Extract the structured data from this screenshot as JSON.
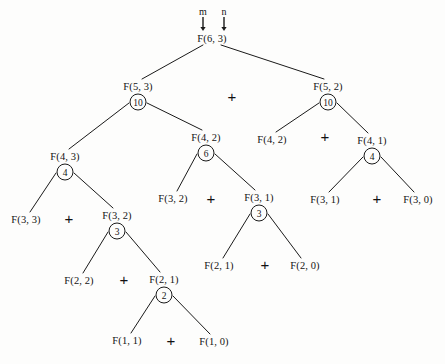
{
  "diagram": {
    "root_label": "F(6, 3)",
    "annotations": [
      {
        "name": "m-pointer",
        "text": "m",
        "x": 203,
        "y": 11
      },
      {
        "name": "n-pointer",
        "text": "n",
        "x": 224,
        "y": 11
      }
    ],
    "arrows": [
      {
        "name": "m-arrow",
        "x": 203,
        "y": 17,
        "length": 11
      },
      {
        "name": "n-arrow",
        "x": 224,
        "y": 17,
        "length": 11
      }
    ],
    "nodes": [
      {
        "id": "n0",
        "label": "F(6, 3)",
        "x": 212,
        "y": 38,
        "value": null
      },
      {
        "id": "n1",
        "label": "F(5, 3)",
        "x": 138,
        "y": 86,
        "value": "10"
      },
      {
        "id": "n2",
        "label": "F(5, 2)",
        "x": 328,
        "y": 86,
        "value": "10"
      },
      {
        "id": "n3",
        "label": "F(4, 3)",
        "x": 65,
        "y": 156,
        "value": "4"
      },
      {
        "id": "n4",
        "label": "F(4, 2)",
        "x": 206,
        "y": 137,
        "value": "6"
      },
      {
        "id": "n5",
        "label": "F(4, 2)",
        "x": 272,
        "y": 139,
        "value": null
      },
      {
        "id": "n6",
        "label": "F(4, 1)",
        "x": 372,
        "y": 140,
        "value": "4"
      },
      {
        "id": "n7",
        "label": "F(3, 3)",
        "x": 26,
        "y": 219,
        "value": null
      },
      {
        "id": "n8",
        "label": "F(3, 2)",
        "x": 117,
        "y": 215,
        "value": "3"
      },
      {
        "id": "n9",
        "label": "F(3, 2)",
        "x": 173,
        "y": 198,
        "value": null
      },
      {
        "id": "n10",
        "label": "F(3, 1)",
        "x": 259,
        "y": 197,
        "value": "3"
      },
      {
        "id": "n11",
        "label": "F(3, 1)",
        "x": 325,
        "y": 199,
        "value": null
      },
      {
        "id": "n12",
        "label": "F(3, 0)",
        "x": 418,
        "y": 199,
        "value": null
      },
      {
        "id": "n13",
        "label": "F(2, 2)",
        "x": 79,
        "y": 280,
        "value": null
      },
      {
        "id": "n14",
        "label": "F(2, 1)",
        "x": 164,
        "y": 279,
        "value": "2"
      },
      {
        "id": "n15",
        "label": "F(2, 1)",
        "x": 219,
        "y": 265,
        "value": null
      },
      {
        "id": "n16",
        "label": "F(2, 0)",
        "x": 305,
        "y": 265,
        "value": null
      },
      {
        "id": "n17",
        "label": "F(1, 1)",
        "x": 127,
        "y": 340,
        "value": null
      },
      {
        "id": "n18",
        "label": "F(1, 0)",
        "x": 214,
        "y": 341,
        "value": null
      }
    ],
    "plus_signs": [
      {
        "name": "plus-root",
        "x": 232,
        "y": 96
      },
      {
        "name": "plus-n2",
        "x": 325,
        "y": 136
      },
      {
        "name": "plus-n1",
        "x": 211,
        "y": 198
      },
      {
        "name": "plus-n6",
        "x": 377,
        "y": 198
      },
      {
        "name": "plus-n3",
        "x": 69,
        "y": 218
      },
      {
        "name": "plus-n10",
        "x": 265,
        "y": 264
      },
      {
        "name": "plus-n8",
        "x": 124,
        "y": 279
      },
      {
        "name": "plus-n14",
        "x": 171,
        "y": 340
      }
    ],
    "edges": [
      {
        "from": "n0",
        "to": "n1"
      },
      {
        "from": "n0",
        "to": "n2"
      },
      {
        "from": "n1",
        "to": "n3"
      },
      {
        "from": "n1",
        "to": "n4"
      },
      {
        "from": "n2",
        "to": "n5"
      },
      {
        "from": "n2",
        "to": "n6"
      },
      {
        "from": "n3",
        "to": "n7"
      },
      {
        "from": "n3",
        "to": "n8"
      },
      {
        "from": "n4",
        "to": "n9"
      },
      {
        "from": "n4",
        "to": "n10"
      },
      {
        "from": "n6",
        "to": "n11"
      },
      {
        "from": "n6",
        "to": "n12"
      },
      {
        "from": "n8",
        "to": "n13"
      },
      {
        "from": "n8",
        "to": "n14"
      },
      {
        "from": "n10",
        "to": "n15"
      },
      {
        "from": "n10",
        "to": "n16"
      },
      {
        "from": "n14",
        "to": "n17"
      },
      {
        "from": "n14",
        "to": "n18"
      }
    ],
    "style": {
      "edge_color": "#1a1a1a",
      "edge_width": 1,
      "text_color": "#141414",
      "background": "#fdfdfc"
    }
  }
}
